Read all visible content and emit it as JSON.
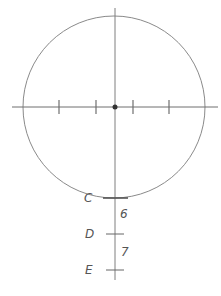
{
  "diagram": {
    "colors": {
      "line": "#7a7a7a",
      "dot": "#333333",
      "text": "#555555",
      "background": "#ffffff"
    },
    "circle": {
      "cx": 114,
      "cy": 107,
      "r": 91
    },
    "center_dot": {
      "x": 115,
      "y": 107
    },
    "horizontal_axis": {
      "y": 107,
      "x1": 12,
      "x2": 218,
      "ticks_x": [
        59,
        96,
        133,
        169
      ]
    },
    "vertical_axis": {
      "x": 115,
      "y1": 8,
      "y2": 280
    },
    "points": [
      {
        "label": "C",
        "y": 198
      },
      {
        "label": "D",
        "y": 234
      },
      {
        "label": "E",
        "y": 270
      }
    ],
    "segments": [
      {
        "label": "6",
        "between": [
          "C",
          "D"
        ]
      },
      {
        "label": "7",
        "between": [
          "D",
          "E"
        ]
      }
    ]
  }
}
